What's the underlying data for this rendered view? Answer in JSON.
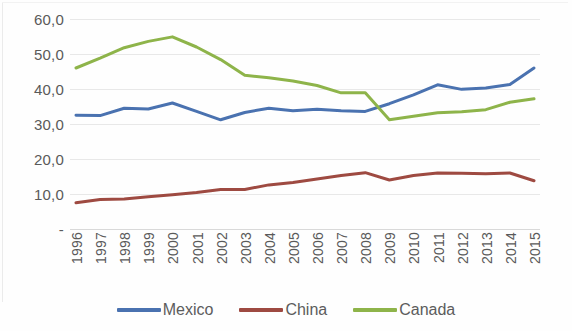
{
  "chart_data": {
    "type": "line",
    "title": "",
    "subtitle": "",
    "xlabel": "",
    "ylabel": "",
    "categories": [
      "1996",
      "1997",
      "1998",
      "1999",
      "2000",
      "2001",
      "2002",
      "2003",
      "2004",
      "2005",
      "2006",
      "2007",
      "2008",
      "2009",
      "2010",
      "2011",
      "2012",
      "2013",
      "2014",
      "2015"
    ],
    "ytick_labels": [
      "60,0",
      "50,0",
      "40,0",
      "30,0",
      "20,0",
      "10,0",
      "-"
    ],
    "ytick_values": [
      60,
      50,
      40,
      30,
      20,
      10,
      0
    ],
    "ylim": [
      0,
      60
    ],
    "grid": true,
    "legend_position": "bottom",
    "series": [
      {
        "name": "Mexico",
        "color": "#4A72B0",
        "values": [
          32.5,
          32.4,
          34.5,
          34.3,
          36.0,
          33.6,
          31.2,
          33.3,
          34.5,
          33.8,
          34.2,
          33.8,
          33.6,
          35.8,
          38.3,
          41.2,
          39.9,
          40.3,
          41.3,
          46.0
        ]
      },
      {
        "name": "China",
        "color": "#9E4A41",
        "values": [
          7.5,
          8.4,
          8.6,
          9.2,
          9.8,
          10.4,
          11.3,
          11.3,
          12.6,
          13.3,
          14.3,
          15.3,
          16.1,
          14.0,
          15.3,
          16.0,
          15.9,
          15.8,
          16.0,
          13.8
        ]
      },
      {
        "name": "Canada",
        "color": "#8EB44A",
        "values": [
          46.0,
          48.8,
          51.8,
          53.6,
          54.9,
          52.0,
          48.4,
          43.9,
          43.2,
          42.3,
          41.0,
          38.9,
          38.9,
          31.2,
          32.2,
          33.2,
          33.5,
          34.1,
          36.2,
          37.2
        ]
      }
    ]
  },
  "legend": {
    "items": [
      {
        "label": "Mexico",
        "color": "#4A72B0",
        "icon": "line-swatch"
      },
      {
        "label": "China",
        "color": "#9E4A41",
        "icon": "line-swatch"
      },
      {
        "label": "Canada",
        "color": "#8EB44A",
        "icon": "line-swatch"
      }
    ]
  }
}
